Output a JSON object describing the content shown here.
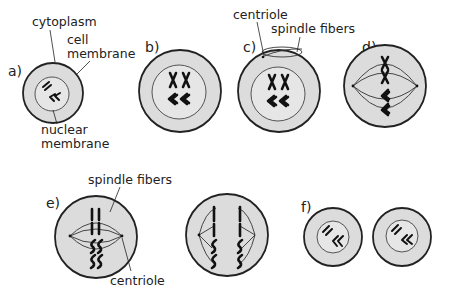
{
  "diagram": {
    "colors": {
      "cytoplasm": "#dcdcdc",
      "outline": "#222222",
      "chromosome": "#111111"
    },
    "stages": [
      {
        "id": "a",
        "label": "a)",
        "annotations": [
          "cytoplasm",
          "cell membrane",
          "nuclear membrane"
        ]
      },
      {
        "id": "b",
        "label": "b)"
      },
      {
        "id": "c",
        "label": "c)",
        "annotations": [
          "centriole",
          "spindle fibers"
        ]
      },
      {
        "id": "d",
        "label": "d)"
      },
      {
        "id": "e",
        "label": "e)",
        "annotations": [
          "spindle fibers",
          "centriole"
        ]
      },
      {
        "id": "f",
        "label": "f)"
      }
    ],
    "annotations": {
      "a_cytoplasm": "cytoplasm",
      "a_cell": "cell",
      "a_membrane": "membrane",
      "a_nuclear": "nuclear",
      "a_nuclear_membrane": "membrane",
      "c_centriole": "centriole",
      "c_spindle": "spindle fibers",
      "e_spindle": "spindle fibers",
      "e_centriole": "centriole"
    }
  }
}
